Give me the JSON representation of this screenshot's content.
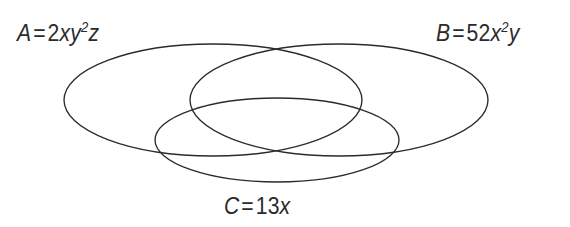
{
  "figure": {
    "kind": "venn-diagram",
    "background_color": "#ffffff",
    "stroke_color": "#2b2b2b",
    "text_color": "#2b2b2b",
    "width": 570,
    "height": 227
  },
  "sets": [
    {
      "id": "A",
      "name": "set-a",
      "label_full": "A = 2xy2z",
      "label_lhs": "A",
      "equals": "=",
      "coefficient": "2",
      "term_1_base": "x",
      "term_2_base": "y",
      "term_2_exponent": "2",
      "term_3_base": "z",
      "position": "top-left",
      "center_x": 213,
      "center_y": 100,
      "radius_x": 149,
      "radius_y": 56
    },
    {
      "id": "B",
      "name": "set-b",
      "label_full": "B = 52x2y",
      "label_lhs": "B",
      "equals": "=",
      "coefficient": "52",
      "term_1_base": "x",
      "term_1_exponent": "2",
      "term_2_base": "y",
      "position": "top-right",
      "center_x": 339,
      "center_y": 100,
      "radius_x": 149,
      "radius_y": 56
    },
    {
      "id": "C",
      "name": "set-c",
      "label_full": "C = 13x",
      "label_lhs": "C",
      "equals": "=",
      "coefficient": "13",
      "term_1_base": "x",
      "position": "bottom-center",
      "center_x": 277,
      "center_y": 140,
      "radius_x": 122,
      "radius_y": 42
    }
  ]
}
